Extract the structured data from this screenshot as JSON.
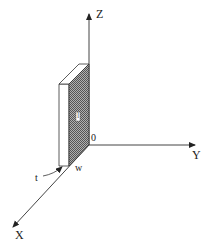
{
  "diagram": {
    "type": "3d-coordinate-system-with-slab",
    "axes": {
      "z": {
        "label": "Z"
      },
      "y": {
        "label": "Y"
      },
      "x": {
        "label": "X"
      }
    },
    "origin_label": "0",
    "slab": {
      "face_label": "l",
      "width_label": "w",
      "thickness_label": "t"
    },
    "colors": {
      "line": "#222222",
      "shaded_face": "#8a8a8a",
      "side_face": "#ffffff"
    }
  }
}
